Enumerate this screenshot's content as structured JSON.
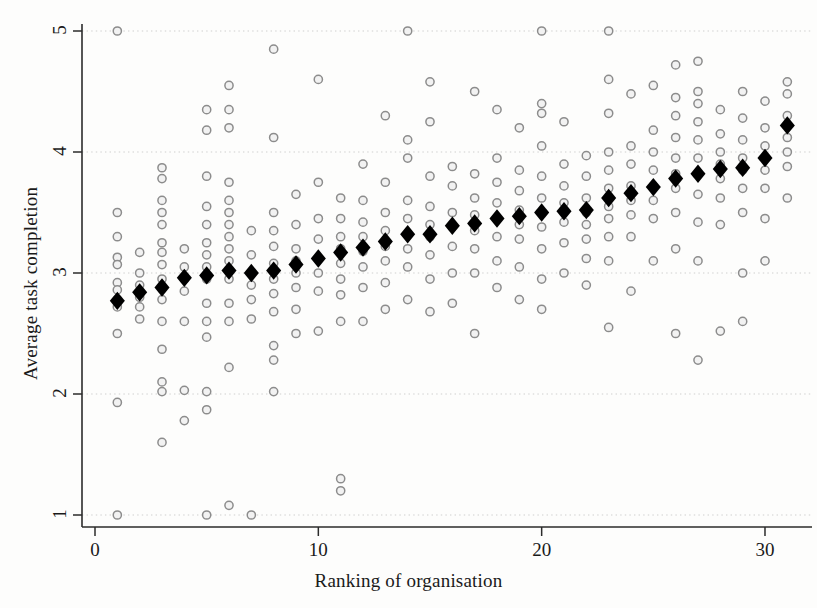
{
  "chart_data": {
    "type": "scatter",
    "title": "",
    "xlabel": "Ranking of organisation",
    "ylabel": "Average task completion",
    "xlim": [
      -0.6,
      32.2
    ],
    "ylim": [
      0.72,
      5.2
    ],
    "xticks": [
      0,
      10,
      20,
      30
    ],
    "xtick_labels": [
      "0",
      "10",
      "20",
      "30"
    ],
    "yticks": [
      1,
      2,
      3,
      4,
      5
    ],
    "ytick_labels": [
      "1",
      "2",
      "3",
      "4",
      "5"
    ],
    "grid": "horizontal-dotted",
    "legend": "none",
    "series": [
      {
        "name": "Individual responses",
        "marker": "circle-open",
        "color": "#8c8c8c",
        "points": [
          [
            1,
            5.0
          ],
          [
            1,
            3.5
          ],
          [
            1,
            3.3
          ],
          [
            1,
            3.13
          ],
          [
            1,
            3.07
          ],
          [
            1,
            2.92
          ],
          [
            1,
            2.86
          ],
          [
            1,
            2.78
          ],
          [
            1,
            2.72
          ],
          [
            1,
            2.5
          ],
          [
            1,
            1.93
          ],
          [
            1,
            1.0
          ],
          [
            2,
            3.17
          ],
          [
            2,
            3.0
          ],
          [
            2,
            2.9
          ],
          [
            2,
            2.8
          ],
          [
            2,
            2.72
          ],
          [
            2,
            2.62
          ],
          [
            3,
            3.87
          ],
          [
            3,
            3.78
          ],
          [
            3,
            3.6
          ],
          [
            3,
            3.5
          ],
          [
            3,
            3.4
          ],
          [
            3,
            3.25
          ],
          [
            3,
            3.17
          ],
          [
            3,
            3.07
          ],
          [
            3,
            2.95
          ],
          [
            3,
            2.87
          ],
          [
            3,
            2.78
          ],
          [
            3,
            2.6
          ],
          [
            3,
            2.37
          ],
          [
            3,
            2.1
          ],
          [
            3,
            2.02
          ],
          [
            3,
            1.6
          ],
          [
            4,
            3.2
          ],
          [
            4,
            3.05
          ],
          [
            4,
            2.95
          ],
          [
            4,
            2.85
          ],
          [
            4,
            2.6
          ],
          [
            4,
            2.03
          ],
          [
            4,
            1.78
          ],
          [
            5,
            4.35
          ],
          [
            5,
            4.18
          ],
          [
            5,
            3.8
          ],
          [
            5,
            3.55
          ],
          [
            5,
            3.4
          ],
          [
            5,
            3.25
          ],
          [
            5,
            3.15
          ],
          [
            5,
            3.05
          ],
          [
            5,
            2.95
          ],
          [
            5,
            2.75
          ],
          [
            5,
            2.6
          ],
          [
            5,
            2.47
          ],
          [
            5,
            2.02
          ],
          [
            5,
            1.87
          ],
          [
            5,
            1.0
          ],
          [
            6,
            4.55
          ],
          [
            6,
            4.35
          ],
          [
            6,
            4.2
          ],
          [
            6,
            3.75
          ],
          [
            6,
            3.6
          ],
          [
            6,
            3.5
          ],
          [
            6,
            3.4
          ],
          [
            6,
            3.3
          ],
          [
            6,
            3.2
          ],
          [
            6,
            3.1
          ],
          [
            6,
            2.95
          ],
          [
            6,
            2.75
          ],
          [
            6,
            2.6
          ],
          [
            6,
            2.22
          ],
          [
            6,
            1.08
          ],
          [
            7,
            3.35
          ],
          [
            7,
            3.15
          ],
          [
            7,
            3.0
          ],
          [
            7,
            2.9
          ],
          [
            7,
            2.78
          ],
          [
            7,
            2.62
          ],
          [
            7,
            1.0
          ],
          [
            8,
            4.85
          ],
          [
            8,
            4.12
          ],
          [
            8,
            3.5
          ],
          [
            8,
            3.35
          ],
          [
            8,
            3.22
          ],
          [
            8,
            3.08
          ],
          [
            8,
            2.95
          ],
          [
            8,
            2.83
          ],
          [
            8,
            2.68
          ],
          [
            8,
            2.4
          ],
          [
            8,
            2.28
          ],
          [
            8,
            2.02
          ],
          [
            9,
            3.65
          ],
          [
            9,
            3.4
          ],
          [
            9,
            3.2
          ],
          [
            9,
            3.1
          ],
          [
            9,
            3.0
          ],
          [
            9,
            2.88
          ],
          [
            9,
            2.7
          ],
          [
            9,
            2.5
          ],
          [
            10,
            4.6
          ],
          [
            10,
            3.75
          ],
          [
            10,
            3.45
          ],
          [
            10,
            3.28
          ],
          [
            10,
            3.12
          ],
          [
            10,
            3.0
          ],
          [
            10,
            2.85
          ],
          [
            10,
            2.52
          ],
          [
            11,
            3.62
          ],
          [
            11,
            3.45
          ],
          [
            11,
            3.3
          ],
          [
            11,
            3.2
          ],
          [
            11,
            3.08
          ],
          [
            11,
            2.95
          ],
          [
            11,
            2.82
          ],
          [
            11,
            2.6
          ],
          [
            11,
            1.3
          ],
          [
            11,
            1.2
          ],
          [
            12,
            3.9
          ],
          [
            12,
            3.6
          ],
          [
            12,
            3.42
          ],
          [
            12,
            3.3
          ],
          [
            12,
            3.18
          ],
          [
            12,
            3.05
          ],
          [
            12,
            2.88
          ],
          [
            12,
            2.6
          ],
          [
            13,
            4.3
          ],
          [
            13,
            3.75
          ],
          [
            13,
            3.5
          ],
          [
            13,
            3.35
          ],
          [
            13,
            3.22
          ],
          [
            13,
            3.1
          ],
          [
            13,
            2.92
          ],
          [
            13,
            2.7
          ],
          [
            14,
            5.0
          ],
          [
            14,
            4.1
          ],
          [
            14,
            3.95
          ],
          [
            14,
            3.6
          ],
          [
            14,
            3.45
          ],
          [
            14,
            3.32
          ],
          [
            14,
            3.2
          ],
          [
            14,
            3.05
          ],
          [
            14,
            2.78
          ],
          [
            15,
            4.58
          ],
          [
            15,
            4.25
          ],
          [
            15,
            3.8
          ],
          [
            15,
            3.55
          ],
          [
            15,
            3.4
          ],
          [
            15,
            3.3
          ],
          [
            15,
            3.15
          ],
          [
            15,
            2.95
          ],
          [
            15,
            2.68
          ],
          [
            16,
            3.88
          ],
          [
            16,
            3.72
          ],
          [
            16,
            3.5
          ],
          [
            16,
            3.38
          ],
          [
            16,
            3.22
          ],
          [
            16,
            3.0
          ],
          [
            16,
            2.75
          ],
          [
            17,
            4.5
          ],
          [
            17,
            3.82
          ],
          [
            17,
            3.62
          ],
          [
            17,
            3.48
          ],
          [
            17,
            3.35
          ],
          [
            17,
            3.2
          ],
          [
            17,
            3.0
          ],
          [
            17,
            2.5
          ],
          [
            18,
            4.35
          ],
          [
            18,
            3.95
          ],
          [
            18,
            3.75
          ],
          [
            18,
            3.58
          ],
          [
            18,
            3.45
          ],
          [
            18,
            3.3
          ],
          [
            18,
            3.1
          ],
          [
            18,
            2.88
          ],
          [
            19,
            4.2
          ],
          [
            19,
            3.85
          ],
          [
            19,
            3.68
          ],
          [
            19,
            3.52
          ],
          [
            19,
            3.4
          ],
          [
            19,
            3.28
          ],
          [
            19,
            3.05
          ],
          [
            19,
            2.78
          ],
          [
            20,
            5.0
          ],
          [
            20,
            4.4
          ],
          [
            20,
            4.32
          ],
          [
            20,
            4.05
          ],
          [
            20,
            3.8
          ],
          [
            20,
            3.62
          ],
          [
            20,
            3.5
          ],
          [
            20,
            3.38
          ],
          [
            20,
            3.2
          ],
          [
            20,
            2.95
          ],
          [
            20,
            2.7
          ],
          [
            21,
            4.25
          ],
          [
            21,
            3.9
          ],
          [
            21,
            3.72
          ],
          [
            21,
            3.58
          ],
          [
            21,
            3.42
          ],
          [
            21,
            3.25
          ],
          [
            21,
            3.0
          ],
          [
            22,
            3.97
          ],
          [
            22,
            3.8
          ],
          [
            22,
            3.62
          ],
          [
            22,
            3.5
          ],
          [
            22,
            3.4
          ],
          [
            22,
            3.28
          ],
          [
            22,
            3.12
          ],
          [
            22,
            2.9
          ],
          [
            23,
            5.0
          ],
          [
            23,
            4.6
          ],
          [
            23,
            4.32
          ],
          [
            23,
            4.0
          ],
          [
            23,
            3.85
          ],
          [
            23,
            3.7
          ],
          [
            23,
            3.55
          ],
          [
            23,
            3.45
          ],
          [
            23,
            3.3
          ],
          [
            23,
            3.1
          ],
          [
            23,
            2.55
          ],
          [
            24,
            4.48
          ],
          [
            24,
            4.05
          ],
          [
            24,
            3.9
          ],
          [
            24,
            3.72
          ],
          [
            24,
            3.6
          ],
          [
            24,
            3.48
          ],
          [
            24,
            3.3
          ],
          [
            24,
            2.85
          ],
          [
            25,
            4.55
          ],
          [
            25,
            4.18
          ],
          [
            25,
            4.0
          ],
          [
            25,
            3.85
          ],
          [
            25,
            3.72
          ],
          [
            25,
            3.6
          ],
          [
            25,
            3.45
          ],
          [
            25,
            3.1
          ],
          [
            26,
            4.72
          ],
          [
            26,
            4.45
          ],
          [
            26,
            4.3
          ],
          [
            26,
            4.12
          ],
          [
            26,
            3.95
          ],
          [
            26,
            3.82
          ],
          [
            26,
            3.7
          ],
          [
            26,
            3.5
          ],
          [
            26,
            3.2
          ],
          [
            26,
            2.5
          ],
          [
            27,
            4.75
          ],
          [
            27,
            4.5
          ],
          [
            27,
            4.4
          ],
          [
            27,
            4.25
          ],
          [
            27,
            4.1
          ],
          [
            27,
            3.95
          ],
          [
            27,
            3.82
          ],
          [
            27,
            3.65
          ],
          [
            27,
            3.42
          ],
          [
            27,
            3.1
          ],
          [
            27,
            2.28
          ],
          [
            28,
            4.35
          ],
          [
            28,
            4.15
          ],
          [
            28,
            4.0
          ],
          [
            28,
            3.9
          ],
          [
            28,
            3.78
          ],
          [
            28,
            3.62
          ],
          [
            28,
            3.4
          ],
          [
            28,
            2.52
          ],
          [
            29,
            4.5
          ],
          [
            29,
            4.28
          ],
          [
            29,
            4.1
          ],
          [
            29,
            3.95
          ],
          [
            29,
            3.85
          ],
          [
            29,
            3.7
          ],
          [
            29,
            3.5
          ],
          [
            29,
            3.0
          ],
          [
            29,
            2.6
          ],
          [
            30,
            4.42
          ],
          [
            30,
            4.2
          ],
          [
            30,
            4.05
          ],
          [
            30,
            3.95
          ],
          [
            30,
            3.85
          ],
          [
            30,
            3.7
          ],
          [
            30,
            3.45
          ],
          [
            30,
            3.1
          ],
          [
            31,
            4.58
          ],
          [
            31,
            4.48
          ],
          [
            31,
            4.3
          ],
          [
            31,
            4.12
          ],
          [
            31,
            4.0
          ],
          [
            31,
            3.88
          ],
          [
            31,
            3.62
          ]
        ]
      },
      {
        "name": "Organisation mean",
        "marker": "diamond-filled",
        "color": "#000000",
        "points": [
          [
            1,
            2.77
          ],
          [
            2,
            2.84
          ],
          [
            3,
            2.88
          ],
          [
            4,
            2.96
          ],
          [
            5,
            2.98
          ],
          [
            6,
            3.02
          ],
          [
            7,
            3.0
          ],
          [
            8,
            3.02
          ],
          [
            9,
            3.07
          ],
          [
            10,
            3.12
          ],
          [
            11,
            3.17
          ],
          [
            12,
            3.21
          ],
          [
            13,
            3.26
          ],
          [
            14,
            3.32
          ],
          [
            15,
            3.32
          ],
          [
            16,
            3.39
          ],
          [
            17,
            3.41
          ],
          [
            18,
            3.45
          ],
          [
            19,
            3.47
          ],
          [
            20,
            3.5
          ],
          [
            21,
            3.51
          ],
          [
            22,
            3.52
          ],
          [
            23,
            3.62
          ],
          [
            24,
            3.66
          ],
          [
            25,
            3.71
          ],
          [
            26,
            3.78
          ],
          [
            27,
            3.82
          ],
          [
            28,
            3.86
          ],
          [
            29,
            3.87
          ],
          [
            30,
            3.95
          ],
          [
            31,
            4.22
          ]
        ]
      }
    ]
  }
}
